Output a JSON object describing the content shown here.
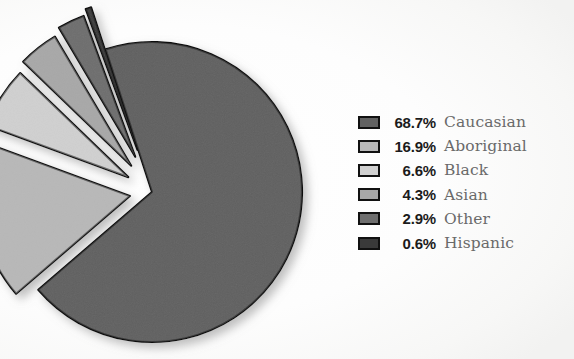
{
  "chart_data": {
    "type": "pie",
    "title": "",
    "title_cropped": true,
    "xlabel": "",
    "ylabel": "",
    "legend_position": "right",
    "grid": false,
    "units": "percent",
    "categories": [
      "Caucasian",
      "Aboriginal",
      "Black",
      "Asian",
      "Other",
      "Hispanic"
    ],
    "values": [
      68.7,
      16.9,
      6.6,
      4.3,
      2.9,
      0.6
    ],
    "value_labels": [
      "68.7%",
      "16.9%",
      "6.6%",
      "4.3%",
      "2.9%",
      "0.6%"
    ],
    "colors": [
      "#616161",
      "#b8b8b8",
      "#d0d0d0",
      "#a8a8a8",
      "#6e6e6e",
      "#3a3a3a"
    ],
    "exploded": [
      false,
      true,
      true,
      true,
      true,
      true
    ],
    "slices": [
      {
        "label": "Caucasian",
        "value": 68.7,
        "value_label": "68.7%",
        "color": "#616161",
        "exploded": false
      },
      {
        "label": "Aboriginal",
        "value": 16.9,
        "value_label": "16.9%",
        "color": "#b8b8b8",
        "exploded": true
      },
      {
        "label": "Black",
        "value": 6.6,
        "value_label": "6.6%",
        "color": "#d0d0d0",
        "exploded": true
      },
      {
        "label": "Asian",
        "value": 4.3,
        "value_label": "4.3%",
        "color": "#a8a8a8",
        "exploded": true
      },
      {
        "label": "Other",
        "value": 2.9,
        "value_label": "2.9%",
        "color": "#6e6e6e",
        "exploded": true
      },
      {
        "label": "Hispanic",
        "value": 0.6,
        "value_label": "0.6%",
        "color": "#3a3a3a",
        "exploded": true
      }
    ]
  },
  "legend": {
    "rows": [
      {
        "pct": "68.7%",
        "label": "Caucasian",
        "color": "#616161"
      },
      {
        "pct": "16.9%",
        "label": "Aboriginal",
        "color": "#b8b8b8"
      },
      {
        "pct": "6.6%",
        "label": "Black",
        "color": "#d0d0d0"
      },
      {
        "pct": "4.3%",
        "label": "Asian",
        "color": "#a8a8a8"
      },
      {
        "pct": "2.9%",
        "label": "Other",
        "color": "#6e6e6e"
      },
      {
        "pct": "0.6%",
        "label": "Hispanic",
        "color": "#3a3a3a"
      }
    ]
  },
  "style": {
    "background": "#ffffff",
    "outline": "#111111",
    "label_color": "#6a6a6a",
    "pct_color": "#1b1b1b"
  }
}
